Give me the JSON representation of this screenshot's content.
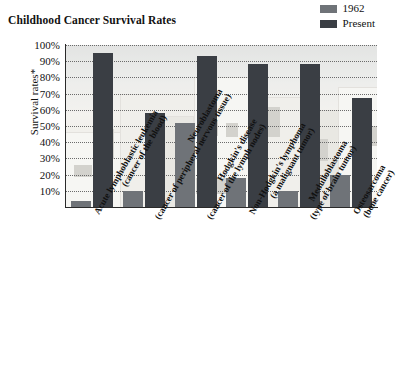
{
  "title": "Childhood Cancer Survival Rates",
  "legend": {
    "position": "top-right",
    "entries": [
      {
        "label": "1962",
        "color": "#6f7378",
        "icon": "legend-swatch"
      },
      {
        "label": "Present",
        "color": "#3a3e44",
        "icon": "legend-swatch"
      }
    ]
  },
  "axes": {
    "ylabel": "Survival rates*",
    "yticks": [
      "100%",
      "90%",
      "80%",
      "70%",
      "60%",
      "50%",
      "40%",
      "30%",
      "20%",
      "10%"
    ],
    "ymin": 0,
    "ymax": 100,
    "grid": true
  },
  "chart_data": {
    "type": "bar",
    "title": "Childhood Cancer Survival Rates",
    "xlabel": "",
    "ylabel": "Survival rates*",
    "ylim": [
      0,
      100
    ],
    "grid": true,
    "legend_position": "top-right",
    "categories": [
      "Acute lymphoblastic leukemia (cancer of the blood)",
      "Neuroblastoma (cancer of peripheral nervous tissue)",
      "Hodgkin's disease (cancer of the lymph nodes)",
      "Non-Hodgkin's lymphoma (a malignant tumor)",
      "Medulloblastoma (type of brain tumor)",
      "Osteosarcoma (bone cancer)"
    ],
    "category_lines": [
      [
        "Acute lymphoblastic leukemia",
        "(cancer of the blood)"
      ],
      [
        "Neuroblastoma",
        "(cancer of peripheral nervous tissue)"
      ],
      [
        "Hodgkin's disease",
        "(cancer of the lymph nodes)"
      ],
      [
        "Non-Hodgkin's lymphoma",
        "(a malignant tumor)"
      ],
      [
        "Medulloblastoma",
        "(type of brain tumor)"
      ],
      [
        "Osteosarcoma",
        "(bone cancer)"
      ]
    ],
    "series": [
      {
        "name": "1962",
        "color": "#6f7378",
        "values": [
          4,
          10,
          52,
          18,
          10,
          20
        ]
      },
      {
        "name": "Present",
        "color": "#3a3e44",
        "values": [
          95,
          58,
          93,
          88,
          88,
          67
        ]
      }
    ]
  }
}
